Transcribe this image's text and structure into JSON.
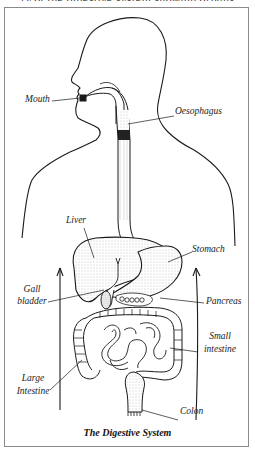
{
  "figure": {
    "top_cut_text": "...ry of the digestive system showing organs...",
    "caption": "The Digestive System",
    "colors": {
      "line": "#1a1a1a",
      "frame": "#8a8a8a",
      "background": "#ffffff",
      "stipple": "#9a9a9a"
    }
  },
  "labels": {
    "mouth": "Mouth",
    "oesophagus": "Oesophagus",
    "liver": "Liver",
    "stomach": "Stomach",
    "gall_bladder_1": "Gall",
    "gall_bladder_2": "bladder",
    "pancreas": "Pancreas",
    "small_intestine_1": "Small",
    "small_intestine_2": "intestine",
    "large_intestine_1": "Large",
    "large_intestine_2": "Intestine",
    "colon": "Colon"
  }
}
